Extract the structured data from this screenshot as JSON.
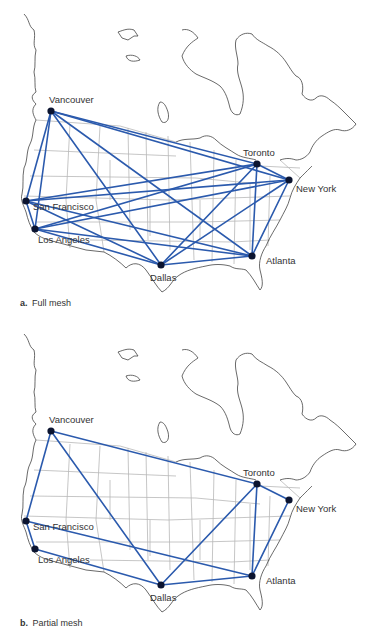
{
  "colors": {
    "edge": "#2b5aad",
    "node": "#0b1430",
    "coast": "#444444",
    "border": "#b8b8b8"
  },
  "cities": [
    {
      "id": "vancouver",
      "name": "Vancouver",
      "x": 51,
      "y": 111,
      "lx": 49,
      "ly": 103
    },
    {
      "id": "toronto",
      "name": "Toronto",
      "x": 257,
      "y": 164,
      "lx": 243,
      "ly": 156
    },
    {
      "id": "newyork",
      "name": "New York",
      "x": 289,
      "y": 180,
      "lx": 296,
      "ly": 192
    },
    {
      "id": "sanfrancisco",
      "name": "San Francisco",
      "x": 26,
      "y": 201,
      "lx": 33,
      "ly": 210
    },
    {
      "id": "losangeles",
      "name": "Los Angeles",
      "x": 35,
      "y": 229,
      "lx": 38,
      "ly": 243
    },
    {
      "id": "dallas",
      "name": "Dallas",
      "x": 161,
      "y": 265,
      "lx": 150,
      "ly": 281
    },
    {
      "id": "atlanta",
      "name": "Atlanta",
      "x": 252,
      "y": 256,
      "lx": 266,
      "ly": 264
    }
  ],
  "panels": [
    {
      "id": "full",
      "caption_letter": "a.",
      "caption_text": "Full mesh",
      "edges": [
        [
          "vancouver",
          "toronto"
        ],
        [
          "vancouver",
          "newyork"
        ],
        [
          "vancouver",
          "sanfrancisco"
        ],
        [
          "vancouver",
          "losangeles"
        ],
        [
          "vancouver",
          "dallas"
        ],
        [
          "vancouver",
          "atlanta"
        ],
        [
          "toronto",
          "newyork"
        ],
        [
          "toronto",
          "sanfrancisco"
        ],
        [
          "toronto",
          "losangeles"
        ],
        [
          "toronto",
          "dallas"
        ],
        [
          "toronto",
          "atlanta"
        ],
        [
          "newyork",
          "sanfrancisco"
        ],
        [
          "newyork",
          "losangeles"
        ],
        [
          "newyork",
          "dallas"
        ],
        [
          "newyork",
          "atlanta"
        ],
        [
          "sanfrancisco",
          "losangeles"
        ],
        [
          "sanfrancisco",
          "dallas"
        ],
        [
          "sanfrancisco",
          "atlanta"
        ],
        [
          "losangeles",
          "dallas"
        ],
        [
          "losangeles",
          "atlanta"
        ],
        [
          "dallas",
          "atlanta"
        ]
      ]
    },
    {
      "id": "partial",
      "caption_letter": "b.",
      "caption_text": "Partial mesh",
      "edges": [
        [
          "vancouver",
          "toronto"
        ],
        [
          "vancouver",
          "sanfrancisco"
        ],
        [
          "vancouver",
          "dallas"
        ],
        [
          "toronto",
          "newyork"
        ],
        [
          "toronto",
          "dallas"
        ],
        [
          "toronto",
          "atlanta"
        ],
        [
          "newyork",
          "atlanta"
        ],
        [
          "sanfrancisco",
          "losangeles"
        ],
        [
          "sanfrancisco",
          "atlanta"
        ],
        [
          "losangeles",
          "dallas"
        ],
        [
          "dallas",
          "atlanta"
        ]
      ]
    }
  ]
}
